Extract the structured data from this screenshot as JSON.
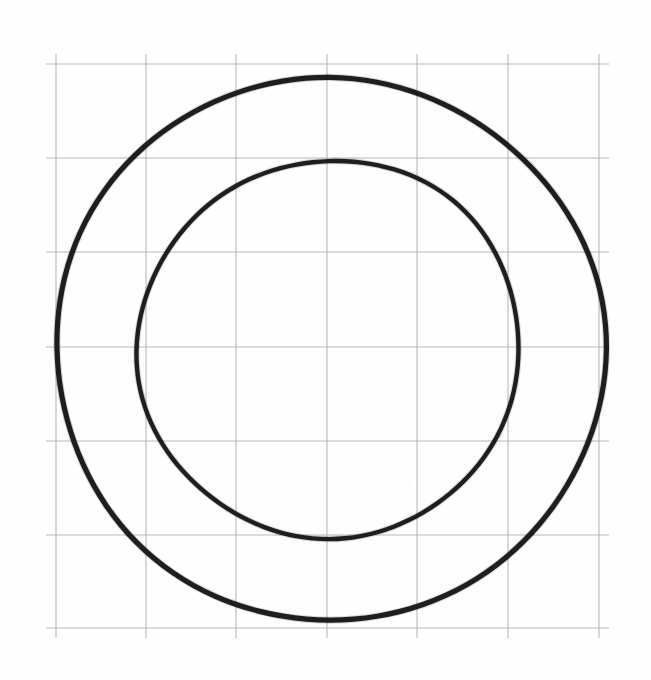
{
  "document": {
    "title": "Concentric Circles on Grid Paper",
    "medium": "hand-drawn pencil sketch on graph paper",
    "background_color": "#fefefe",
    "width": 651,
    "height": 680
  },
  "chart_data": {
    "type": "scatter",
    "title": "",
    "subtitle": "",
    "xlabel": "",
    "ylabel": "",
    "grid": true,
    "legend_position": "none",
    "tick_labels_x": [],
    "tick_labels_y": [],
    "xlim": [
      56,
      599
    ],
    "ylim": [
      64,
      628
    ],
    "grid_spec": {
      "line_color": "#a9a9ab",
      "line_width": 1.1,
      "vertical_lines_x": [
        56,
        146,
        236,
        327,
        417,
        508,
        599
      ],
      "horizontal_lines_y": [
        64,
        158,
        252,
        347,
        441,
        535,
        628
      ],
      "cell_width": 90.5,
      "cell_height": 94,
      "columns": 6,
      "rows": 6
    },
    "shapes": [
      {
        "name": "outer-circle",
        "kind": "circle",
        "center_x": 330,
        "center_y": 349,
        "radius": 273,
        "stroke_color": "#141414",
        "stroke_width": 5.2,
        "extent_left": 57,
        "extent_right": 603,
        "extent_top": 76,
        "extent_bottom": 622
      },
      {
        "name": "inner-circle",
        "kind": "circle",
        "center_x": 329,
        "center_y": 349,
        "radius": 190,
        "stroke_color": "#141414",
        "stroke_width": 4.4,
        "extent_left": 139,
        "extent_right": 519,
        "extent_top": 159,
        "extent_bottom": 539
      }
    ],
    "annotations": []
  },
  "labels": {
    "figure_caption": "",
    "outer_circle_name": "outer circle",
    "inner_circle_name": "inner circle",
    "grid_name": "graph paper grid"
  }
}
